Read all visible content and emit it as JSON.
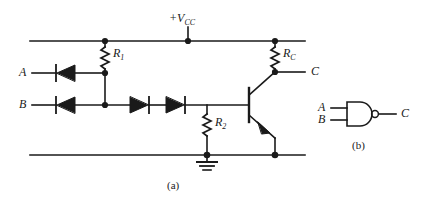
{
  "figure": {
    "caption_a": "(a)",
    "caption_b": "(b)"
  },
  "circuit_a": {
    "supply_label": "+V",
    "supply_sub": "CC",
    "input_a_label": "A",
    "input_b_label": "B",
    "output_label": "C",
    "r1_label": "R",
    "r1_sub": "1",
    "rc_label": "R",
    "rc_sub": "C",
    "r2_label": "R",
    "r2_sub": "2",
    "components": {
      "diode_a": "diode-input-a",
      "diode_b": "diode-input-b",
      "diode_level_1": "series-diode-1",
      "diode_level_2": "series-diode-2",
      "transistor": "npn-transistor",
      "ground": "ground-symbol"
    }
  },
  "logic_b": {
    "input_a_label": "A",
    "input_b_label": "B",
    "output_label": "C",
    "gate_type": "nand-gate"
  },
  "colors": {
    "ink": "#1a1a1a",
    "background": "#ffffff"
  }
}
